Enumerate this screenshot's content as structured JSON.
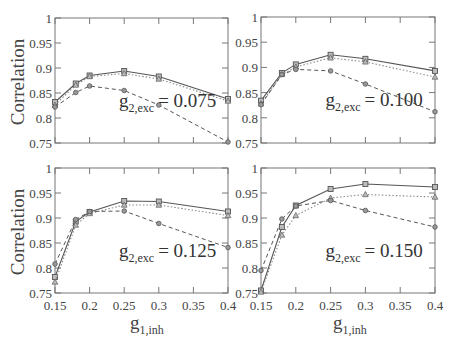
{
  "figure": {
    "ylabel": "Correlation",
    "xlabel_main": "g",
    "xlabel_sub": "1,inh",
    "annotation_prefix": "g",
    "annotation_sub": "2,exc",
    "colors": {
      "solid": "#555555",
      "dotted": "#8a8a8a",
      "dashed": "#555555",
      "frame": "#777777",
      "text": "#444444"
    }
  },
  "chart_data": [
    {
      "type": "line",
      "title": "g2,exc = 0.075",
      "annotation": "= 0.075",
      "xlabel": "",
      "ylabel": "Correlation",
      "x": [
        0.15,
        0.18,
        0.2,
        0.25,
        0.3,
        0.4
      ],
      "xlim": [
        0.15,
        0.4
      ],
      "ylim": [
        0.75,
        1.0
      ],
      "xticks": [
        "0.15",
        "0.2",
        "0.25",
        "0.3",
        "0.35",
        "0.4"
      ],
      "yticks": [
        "0.75",
        "0.8",
        "0.85",
        "0.9",
        "0.95",
        "1"
      ],
      "show_xticklabels": false,
      "show_yticklabels": true,
      "series": [
        {
          "name": "solid-square",
          "style": "solid",
          "marker": "square",
          "values": [
            0.832,
            0.869,
            0.885,
            0.894,
            0.883,
            0.838
          ]
        },
        {
          "name": "dotted-triangle",
          "style": "dotted",
          "marker": "triangle",
          "values": [
            0.826,
            0.866,
            0.883,
            0.889,
            0.878,
            0.834
          ]
        },
        {
          "name": "dashed-circle",
          "style": "dashed",
          "marker": "circle",
          "values": [
            0.822,
            0.851,
            0.864,
            0.855,
            0.826,
            0.752
          ]
        }
      ]
    },
    {
      "type": "line",
      "title": "g2,exc = 0.100",
      "annotation": "= 0.100",
      "xlabel": "",
      "ylabel": "",
      "x": [
        0.15,
        0.18,
        0.2,
        0.25,
        0.3,
        0.4
      ],
      "xlim": [
        0.15,
        0.4
      ],
      "ylim": [
        0.75,
        1.0
      ],
      "xticks": [
        "0.15",
        "0.2",
        "0.25",
        "0.3",
        "0.35",
        "0.4"
      ],
      "yticks": [
        "0.75",
        "0.8",
        "0.85",
        "0.9",
        "0.95",
        "1"
      ],
      "show_xticklabels": false,
      "show_yticklabels": true,
      "series": [
        {
          "name": "solid-square",
          "style": "solid",
          "marker": "square",
          "values": [
            0.834,
            0.889,
            0.906,
            0.925,
            0.917,
            0.893
          ]
        },
        {
          "name": "dotted-triangle",
          "style": "dotted",
          "marker": "triangle",
          "values": [
            0.828,
            0.886,
            0.901,
            0.919,
            0.911,
            0.881
          ]
        },
        {
          "name": "dashed-circle",
          "style": "dashed",
          "marker": "circle",
          "values": [
            0.826,
            0.886,
            0.896,
            0.893,
            0.867,
            0.812
          ]
        }
      ]
    },
    {
      "type": "line",
      "title": "g2,exc = 0.125",
      "annotation": "= 0.125",
      "xlabel": "g1,inh",
      "ylabel": "Correlation",
      "x": [
        0.15,
        0.18,
        0.2,
        0.25,
        0.3,
        0.4
      ],
      "xlim": [
        0.15,
        0.4
      ],
      "ylim": [
        0.75,
        1.0
      ],
      "xticks": [
        "0.15",
        "0.2",
        "0.25",
        "0.3",
        "0.35",
        "0.4"
      ],
      "yticks": [
        "0.75",
        "0.8",
        "0.85",
        "0.9",
        "0.95",
        "1"
      ],
      "show_xticklabels": true,
      "show_yticklabels": true,
      "series": [
        {
          "name": "solid-square",
          "style": "solid",
          "marker": "square",
          "values": [
            0.782,
            0.893,
            0.912,
            0.934,
            0.933,
            0.913
          ]
        },
        {
          "name": "dotted-triangle",
          "style": "dotted",
          "marker": "triangle",
          "values": [
            0.772,
            0.886,
            0.909,
            0.926,
            0.926,
            0.905
          ]
        },
        {
          "name": "dashed-circle",
          "style": "dashed",
          "marker": "circle",
          "values": [
            0.808,
            0.897,
            0.913,
            0.914,
            0.889,
            0.841
          ]
        }
      ]
    },
    {
      "type": "line",
      "title": "g2,exc = 0.150",
      "annotation": "= 0.150",
      "xlabel": "g1,inh",
      "ylabel": "",
      "x": [
        0.15,
        0.18,
        0.2,
        0.25,
        0.3,
        0.4
      ],
      "xlim": [
        0.15,
        0.4
      ],
      "ylim": [
        0.75,
        1.0
      ],
      "xticks": [
        "0.15",
        "0.2",
        "0.25",
        "0.3",
        "0.35",
        "0.4"
      ],
      "yticks": [
        "0.75",
        "0.8",
        "0.85",
        "0.9",
        "0.95",
        "1"
      ],
      "show_xticklabels": true,
      "show_yticklabels": true,
      "series": [
        {
          "name": "solid-square",
          "style": "solid",
          "marker": "square",
          "values": [
            0.755,
            0.882,
            0.925,
            0.958,
            0.968,
            0.962
          ]
        },
        {
          "name": "dotted-triangle",
          "style": "dotted",
          "marker": "triangle",
          "values": [
            0.752,
            0.866,
            0.905,
            0.94,
            0.947,
            0.942
          ]
        },
        {
          "name": "dashed-circle",
          "style": "dashed",
          "marker": "circle",
          "values": [
            0.795,
            0.898,
            0.924,
            0.935,
            0.915,
            0.882
          ]
        }
      ]
    }
  ]
}
